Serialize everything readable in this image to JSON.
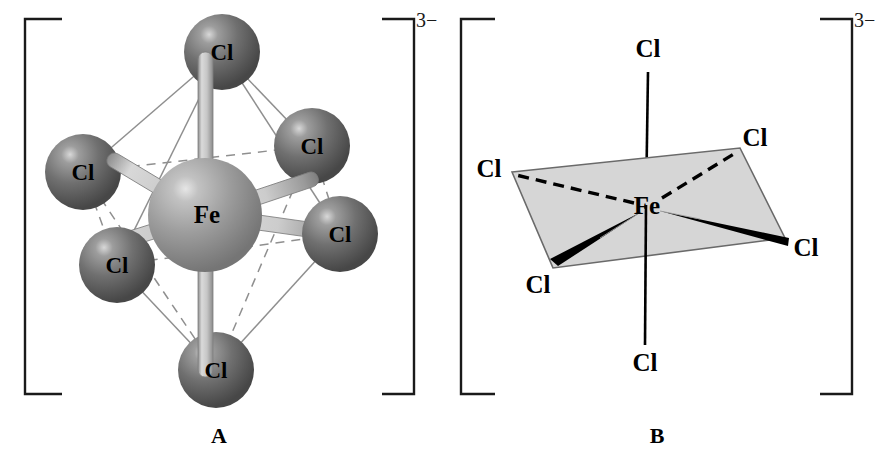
{
  "figure": {
    "background_color": "#ffffff",
    "charge_superscript": "3−",
    "panels": [
      {
        "id": "A",
        "caption": "A",
        "style": "ball-and-stick octahedron",
        "center_atom": {
          "label": "Fe",
          "cx": 205,
          "cy": 215,
          "r": 57,
          "color": "#9b9b9b",
          "highlight_color": "#d9d9d9"
        },
        "ligands": [
          {
            "label": "Cl",
            "position": "axial-top",
            "cx": 222,
            "cy": 52,
            "r": 38
          },
          {
            "label": "Cl",
            "position": "axial-bottom",
            "cx": 216,
            "cy": 370,
            "r": 38
          },
          {
            "label": "Cl",
            "position": "rear-left",
            "cx": 83,
            "cy": 172,
            "r": 38
          },
          {
            "label": "Cl",
            "position": "rear-right",
            "cx": 312,
            "cy": 146,
            "r": 38
          },
          {
            "label": "Cl",
            "position": "front-left",
            "cx": 117,
            "cy": 265,
            "r": 38
          },
          {
            "label": "Cl",
            "position": "front-right",
            "cx": 340,
            "cy": 234,
            "r": 38
          }
        ],
        "ligand_color": "#6e6e6e",
        "ligand_highlight_color": "#b4b4b4",
        "bond_color": "#c8c8c8",
        "bond_edge_color": "#808080",
        "edge_solid_color": "#8a8a8a",
        "edge_dashed_color": "#8a8a8a",
        "bracket_color": "#1a1a1a"
      },
      {
        "id": "B",
        "caption": "B",
        "style": "wedge-dash square planar with axial bonds",
        "center_atom": {
          "label": "Fe",
          "x": 645,
          "y": 205
        },
        "plane_fill": "#d6d6d6",
        "plane_stroke": "#6a6a6a",
        "ligands": [
          {
            "label": "Cl",
            "position": "axial-top",
            "x": 648,
            "y": 48,
            "bond": "plain"
          },
          {
            "label": "Cl",
            "position": "axial-bottom",
            "x": 645,
            "y": 362,
            "bond": "plain"
          },
          {
            "label": "Cl",
            "position": "equatorial-rear-left",
            "x": 489,
            "y": 168,
            "bond": "dashed"
          },
          {
            "label": "Cl",
            "position": "equatorial-rear-right",
            "x": 755,
            "y": 137,
            "bond": "dashed"
          },
          {
            "label": "Cl",
            "position": "equatorial-front-left",
            "x": 538,
            "y": 284,
            "bond": "wedge"
          },
          {
            "label": "Cl",
            "position": "equatorial-front-right",
            "x": 806,
            "y": 247,
            "bond": "wedge"
          }
        ],
        "bond_color": "#000000",
        "bracket_color": "#1a1a1a"
      }
    ]
  }
}
